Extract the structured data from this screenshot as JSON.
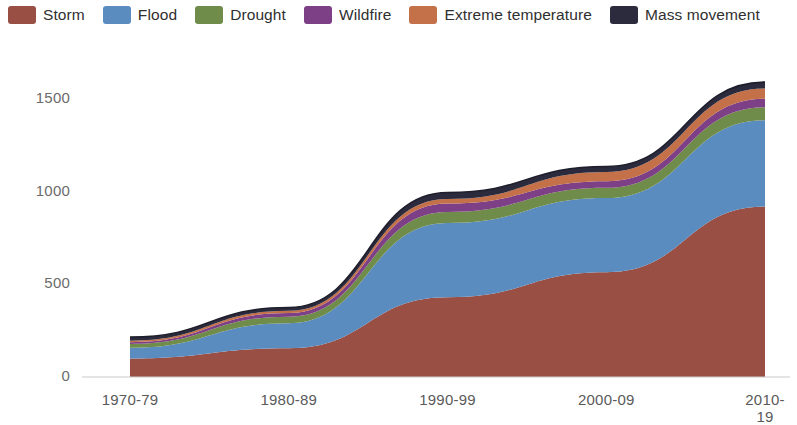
{
  "legend": {
    "position": "top",
    "items": [
      {
        "label": "Storm",
        "color": "#9a4f45",
        "name": "legend-item-storm"
      },
      {
        "label": "Flood",
        "color": "#5b8cc0",
        "name": "legend-item-flood"
      },
      {
        "label": "Drought",
        "color": "#6f8c4a",
        "name": "legend-item-drought"
      },
      {
        "label": "Wildfire",
        "color": "#7d3f86",
        "name": "legend-item-wildfire"
      },
      {
        "label": "Extreme temperature",
        "color": "#c4714a",
        "name": "legend-item-extreme-temperature"
      },
      {
        "label": "Mass movement",
        "color": "#2b2b3d",
        "name": "legend-item-mass-movement"
      }
    ]
  },
  "axes": {
    "y_ticks": [
      "0",
      "500",
      "1000",
      "1500"
    ],
    "y_tick_values": [
      0,
      500,
      1000,
      1500
    ],
    "x_ticks": [
      "1970-79",
      "1980-89",
      "1990-99",
      "2000-09",
      "2010-19"
    ]
  },
  "chart_data": {
    "type": "area",
    "title": "",
    "subtitle": "",
    "xlabel": "",
    "ylabel": "",
    "stacked": true,
    "grid": false,
    "legend_position": "top",
    "ylim": [
      0,
      1650
    ],
    "categories": [
      "1970-79",
      "1980-89",
      "1990-99",
      "2000-09",
      "2010-19"
    ],
    "series": [
      {
        "name": "Storm",
        "color": "#9a4f45",
        "values": [
          100,
          155,
          430,
          565,
          920
        ]
      },
      {
        "name": "Flood",
        "color": "#5b8cc0",
        "values": [
          58,
          135,
          400,
          400,
          465
        ]
      },
      {
        "name": "Drought",
        "color": "#6f8c4a",
        "values": [
          20,
          35,
          60,
          55,
          70
        ]
      },
      {
        "name": "Wildfire",
        "color": "#7d3f86",
        "values": [
          10,
          20,
          45,
          35,
          45
        ]
      },
      {
        "name": "Extreme temperature",
        "color": "#c4714a",
        "values": [
          8,
          12,
          25,
          50,
          55
        ]
      },
      {
        "name": "Mass movement",
        "color": "#2b2b3d",
        "values": [
          19,
          18,
          35,
          30,
          35
        ]
      }
    ],
    "totals": [
      215,
      375,
      995,
      1135,
      1590
    ]
  }
}
